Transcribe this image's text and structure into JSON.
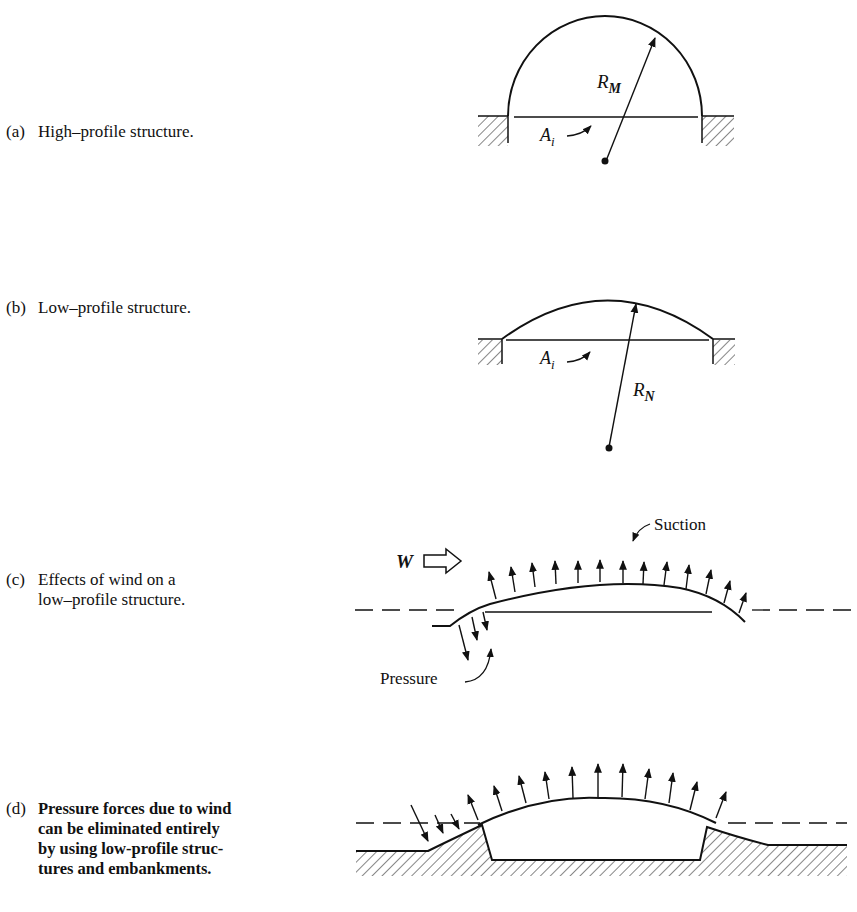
{
  "figure": {
    "panels": [
      {
        "id": "a",
        "tag": "(a)",
        "caption": "High–profile structure.",
        "labels": {
          "radius": "R",
          "radius_sub": "M",
          "area": "A",
          "area_sub": "i"
        }
      },
      {
        "id": "b",
        "tag": "(b)",
        "caption": "Low–profile structure.",
        "labels": {
          "radius": "R",
          "radius_sub": "N",
          "area": "A",
          "area_sub": "i"
        }
      },
      {
        "id": "c",
        "tag": "(c)",
        "caption": "Effects of wind on a\nlow–profile structure.",
        "labels": {
          "wind": "W",
          "suction": "Suction",
          "pressure": "Pressure"
        }
      },
      {
        "id": "d",
        "tag": "(d)",
        "caption": "Pressure forces due to wind\ncan be eliminated entirely\nby using low-profile struc-\ntures and embankments."
      }
    ]
  }
}
